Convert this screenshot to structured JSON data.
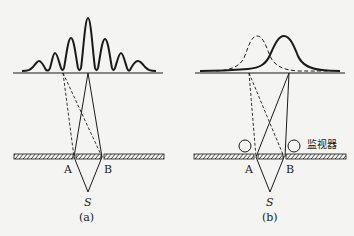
{
  "figure": {
    "panels": [
      {
        "id": "a",
        "caption": "(a)",
        "slit_labels": [
          "A",
          "B"
        ],
        "source_label": "S",
        "pattern": "interference fringes"
      },
      {
        "id": "b",
        "caption": "(b)",
        "slit_labels": [
          "A",
          "B"
        ],
        "source_label": "S",
        "monitor_label": "监视器",
        "pattern": "two single-slit humps (dashed and solid)"
      }
    ],
    "colors": {
      "line": "#1a1a1a",
      "background": "#f4f4f2"
    }
  }
}
